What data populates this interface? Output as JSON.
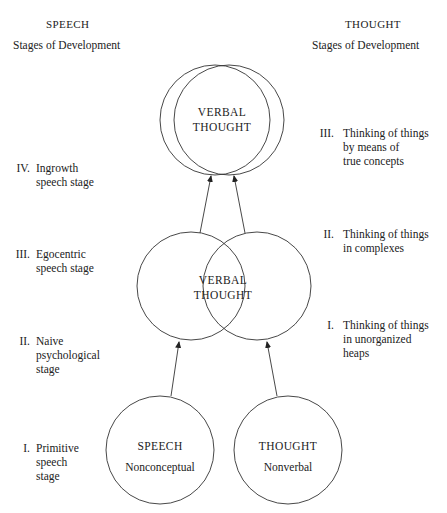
{
  "headers": {
    "left": {
      "title": "SPEECH",
      "subtitle": "Stages of Development"
    },
    "right": {
      "title": "THOUGHT",
      "subtitle": "Stages of Development"
    }
  },
  "speech_stages": [
    {
      "numeral": "IV.",
      "lines": [
        "Ingrowth",
        "speech stage"
      ]
    },
    {
      "numeral": "III.",
      "lines": [
        "Egocentric",
        "speech stage"
      ]
    },
    {
      "numeral": "II.",
      "lines": [
        "Naive",
        "psychological",
        "stage"
      ]
    },
    {
      "numeral": "I.",
      "lines": [
        "Primitive",
        "speech",
        "stage"
      ]
    }
  ],
  "thought_stages": [
    {
      "numeral": "III.",
      "lines": [
        "Thinking of things",
        "by means of",
        "true concepts"
      ]
    },
    {
      "numeral": "II.",
      "lines": [
        "Thinking of things",
        "in complexes"
      ]
    },
    {
      "numeral": "I.",
      "lines": [
        "Thinking of things",
        "in unorganized",
        "heaps"
      ]
    }
  ],
  "circles": {
    "top": {
      "line1": "VERBAL",
      "line2": "THOUGHT"
    },
    "middle": {
      "line1": "VERBAL",
      "line2": "THOUGHT"
    },
    "bottom_left": {
      "title": "SPEECH",
      "subtitle": "Nonconceptual"
    },
    "bottom_right": {
      "title": "THOUGHT",
      "subtitle": "Nonverbal"
    }
  }
}
